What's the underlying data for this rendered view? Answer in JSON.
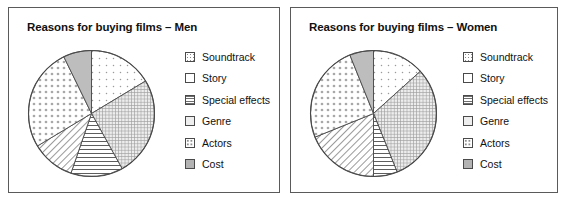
{
  "figure": {
    "background_color": "#ffffff",
    "border_color": "#5a5a5a",
    "panels": [
      {
        "id": "men",
        "title": "Reasons for buying films – Men"
      },
      {
        "id": "women",
        "title": "Reasons for buying films – Women"
      }
    ]
  },
  "legend": {
    "items": [
      {
        "label": "Soundtrack",
        "pattern": "fine-dots",
        "swatch_class": "sw-finedots",
        "color": "#ffffff"
      },
      {
        "label": "Story",
        "pattern": "blank",
        "swatch_class": "sw-blank",
        "color": "#ffffff"
      },
      {
        "label": "Special effects",
        "pattern": "horizontal-lines",
        "swatch_class": "sw-hlines",
        "color": "#ffffff"
      },
      {
        "label": "Genre",
        "pattern": "cross-hatch-grid",
        "swatch_class": "sw-grid",
        "color": "#eeeeee"
      },
      {
        "label": "Actors",
        "pattern": "coarse-dots",
        "swatch_class": "sw-dots",
        "color": "#ffffff"
      },
      {
        "label": "Cost",
        "pattern": "solid-grey",
        "swatch_class": "sw-solid",
        "color": "#b3b3b3"
      }
    ]
  },
  "chart_data": [
    {
      "type": "pie",
      "title": "Reasons for buying films – Men",
      "xlabel": "",
      "ylabel": "",
      "grid": false,
      "legend_position": "right",
      "start_angle_deg": 0,
      "direction": "clockwise",
      "categories": [
        "Soundtrack",
        "Genre",
        "Special effects",
        "Story",
        "Actors",
        "Cost"
      ],
      "values": [
        16.5,
        25.5,
        13.5,
        11.0,
        26.5,
        7.0
      ],
      "units": "percent",
      "slices": [
        {
          "label": "Soundtrack",
          "percent": 16.5,
          "angle_deg": 59,
          "pattern": "fine-dots",
          "svg_fill": "url(#pFineDots)"
        },
        {
          "label": "Genre",
          "percent": 25.5,
          "angle_deg": 92,
          "pattern": "cross-hatch-grid",
          "svg_fill": "url(#pGrid)"
        },
        {
          "label": "Special effects",
          "percent": 13.5,
          "angle_deg": 48,
          "pattern": "horizontal-lines",
          "svg_fill": "url(#pHLines)"
        },
        {
          "label": "Story",
          "percent": 11.0,
          "angle_deg": 40,
          "pattern": "diagonal-hatch",
          "svg_fill": "url(#pHatch)"
        },
        {
          "label": "Actors",
          "percent": 26.5,
          "angle_deg": 95,
          "pattern": "coarse-dots",
          "svg_fill": "url(#pDots)"
        },
        {
          "label": "Cost",
          "percent": 7.0,
          "angle_deg": 26,
          "pattern": "solid-grey",
          "svg_fill": "#bdbdbd"
        }
      ]
    },
    {
      "type": "pie",
      "title": "Reasons for buying films – Women",
      "xlabel": "",
      "ylabel": "",
      "grid": false,
      "legend_position": "right",
      "start_angle_deg": 0,
      "direction": "clockwise",
      "categories": [
        "Soundtrack",
        "Genre",
        "Special effects",
        "Story",
        "Actors",
        "Cost"
      ],
      "values": [
        13.5,
        30.5,
        6.0,
        19.0,
        25.0,
        6.0
      ],
      "units": "percent",
      "slices": [
        {
          "label": "Soundtrack",
          "percent": 13.5,
          "angle_deg": 48,
          "pattern": "fine-dots",
          "svg_fill": "url(#pFineDots)"
        },
        {
          "label": "Genre",
          "percent": 30.5,
          "angle_deg": 110,
          "pattern": "cross-hatch-grid",
          "svg_fill": "url(#pGrid)"
        },
        {
          "label": "Special effects",
          "percent": 6.0,
          "angle_deg": 22,
          "pattern": "horizontal-lines",
          "svg_fill": "url(#pHLines)"
        },
        {
          "label": "Story",
          "percent": 19.0,
          "angle_deg": 68,
          "pattern": "diagonal-hatch",
          "svg_fill": "url(#pHatch)"
        },
        {
          "label": "Actors",
          "percent": 25.0,
          "angle_deg": 90,
          "pattern": "coarse-dots",
          "svg_fill": "url(#pDots)"
        },
        {
          "label": "Cost",
          "percent": 6.0,
          "angle_deg": 22,
          "pattern": "solid-grey",
          "svg_fill": "#bdbdbd"
        }
      ]
    }
  ]
}
